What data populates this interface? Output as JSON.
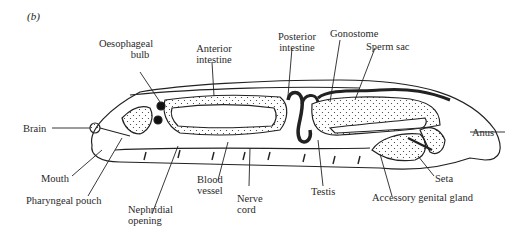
{
  "figure": {
    "panel_label": "(b)",
    "labels": {
      "oesophageal_bulb_1": "Oesophageal",
      "oesophageal_bulb_2": "bulb",
      "anterior_intestine_1": "Anterior",
      "anterior_intestine_2": "intestine",
      "posterior_intestine_1": "Posterior",
      "posterior_intestine_2": "intestine",
      "gonostome": "Gonostome",
      "sperm_sac": "Sperm sac",
      "brain": "Brain",
      "anus": "Anus",
      "mouth": "Mouth",
      "seta": "Seta",
      "pharyngeal_pouch": "Pharyngeal pouch",
      "blood_vessel_1": "Blood",
      "blood_vessel_2": "vessel",
      "testis": "Testis",
      "accessory_genital_gland": "Accessory genital gland",
      "nerve_cord_1": "Nerve",
      "nerve_cord_2": "cord",
      "nephridial_opening_1": "Nephridial",
      "nephridial_opening_2": "opening"
    },
    "colors": {
      "ink": "#222222",
      "background": "#ffffff"
    }
  }
}
